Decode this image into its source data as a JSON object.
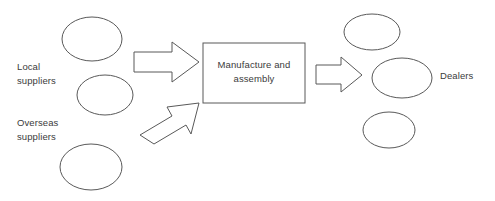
{
  "diagram": {
    "type": "flow-diagram",
    "background_color": "#ffffff",
    "stroke_color": "#595959",
    "text_color": "#3b3b3b",
    "labels": {
      "local_suppliers": "Local\nsuppliers",
      "overseas_suppliers": "Overseas\nsuppliers",
      "dealers": "Dealers",
      "manufacture_assembly": "Manufacture and\nassembly"
    },
    "nodes": [
      {
        "name": "local-supplier-ellipse-1",
        "shape": "ellipse",
        "group": "local-suppliers",
        "cx": 92,
        "cy": 39,
        "rx": 30,
        "ry": 22
      },
      {
        "name": "local-supplier-ellipse-2",
        "shape": "ellipse",
        "group": "local-suppliers",
        "cx": 105,
        "cy": 95,
        "rx": 28,
        "ry": 20
      },
      {
        "name": "overseas-supplier-ellipse-1",
        "shape": "ellipse",
        "group": "overseas-suppliers",
        "cx": 91,
        "cy": 167,
        "rx": 31,
        "ry": 23
      },
      {
        "name": "manufacture-assembly-box",
        "shape": "rect",
        "x": 203,
        "y": 43,
        "width": 102,
        "height": 60
      },
      {
        "name": "dealer-ellipse-1",
        "shape": "ellipse",
        "group": "dealers",
        "cx": 372,
        "cy": 32,
        "rx": 28,
        "ry": 18
      },
      {
        "name": "dealer-ellipse-2",
        "shape": "ellipse",
        "group": "dealers",
        "cx": 402,
        "cy": 78,
        "rx": 30,
        "ry": 20
      },
      {
        "name": "dealer-ellipse-3",
        "shape": "ellipse",
        "group": "dealers",
        "cx": 389,
        "cy": 130,
        "rx": 26,
        "ry": 18
      }
    ],
    "arrows": [
      {
        "name": "arrow-local-to-manufacture",
        "from": "local-suppliers",
        "to": "manufacture-assembly-box",
        "direction": "right",
        "rotation_deg": 0
      },
      {
        "name": "arrow-overseas-to-manufacture",
        "from": "overseas-suppliers",
        "to": "manufacture-assembly-box",
        "direction": "up-right",
        "rotation_deg": -33
      },
      {
        "name": "arrow-manufacture-to-dealers",
        "from": "manufacture-assembly-box",
        "to": "dealers",
        "direction": "right",
        "rotation_deg": 0
      }
    ]
  }
}
